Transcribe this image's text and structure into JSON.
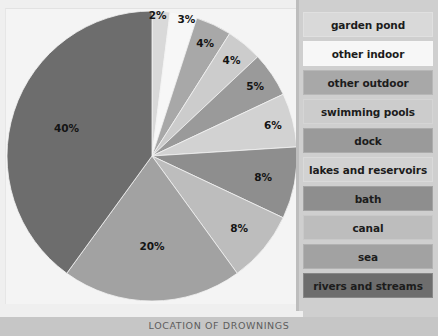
{
  "caption": "LOCATION OF DROWNINGS",
  "legend": {
    "items": [
      {
        "label": "garden pond",
        "color": "#d9d9d9"
      },
      {
        "label": "other indoor",
        "color": "#f7f7f7"
      },
      {
        "label": "other outdoor",
        "color": "#a8a8a8"
      },
      {
        "label": "swimming pools",
        "color": "#cccccc"
      },
      {
        "label": "dock",
        "color": "#9a9a9a"
      },
      {
        "label": "lakes and reservoirs",
        "color": "#d2d2d2"
      },
      {
        "label": "bath",
        "color": "#8e8e8e"
      },
      {
        "label": "canal",
        "color": "#bdbdbd"
      },
      {
        "label": "sea",
        "color": "#a2a2a2"
      },
      {
        "label": "rivers and streams",
        "color": "#6d6d6d"
      }
    ]
  },
  "chart_data": {
    "type": "pie",
    "title": "LOCATION OF DROWNINGS",
    "legend_position": "right",
    "total": 100,
    "unit": "%",
    "categories": [
      "garden pond",
      "other indoor",
      "other outdoor",
      "swimming pools",
      "dock",
      "lakes and reservoirs",
      "bath",
      "canal",
      "sea",
      "rivers and streams"
    ],
    "values": [
      2,
      3,
      4,
      4,
      5,
      6,
      8,
      8,
      20,
      40
    ],
    "labels": [
      "2%",
      "3%",
      "4%",
      "4%",
      "5%",
      "6%",
      "8%",
      "8%",
      "20%",
      "40%"
    ],
    "colors": [
      "#d9d9d9",
      "#f7f7f7",
      "#a8a8a8",
      "#cccccc",
      "#9a9a9a",
      "#d2d2d2",
      "#8e8e8e",
      "#bdbdbd",
      "#a2a2a2",
      "#6d6d6d"
    ],
    "start_angle_deg": -90,
    "direction": "clockwise"
  }
}
